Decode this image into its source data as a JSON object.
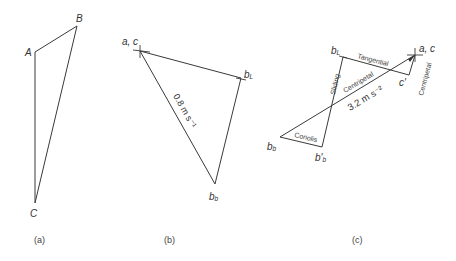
{
  "figure": {
    "panels": [
      {
        "id": "a",
        "caption": "(a)",
        "points": {
          "A": {
            "label": "A",
            "x": 35,
            "y": 52
          },
          "B": {
            "label": "B",
            "x": 77,
            "y": 26
          },
          "C": {
            "label": "C",
            "x": 35,
            "y": 203
          }
        },
        "edges": [
          [
            "A",
            "B"
          ],
          [
            "B",
            "C"
          ],
          [
            "A",
            "C"
          ]
        ]
      },
      {
        "id": "b",
        "caption": "(b)",
        "points": {
          "ac": {
            "label": "a, c",
            "x": 140,
            "y": 51
          },
          "bL": {
            "label": "b",
            "sub": "L",
            "x": 241,
            "y": 78
          },
          "bb": {
            "label": "b",
            "sub": "b",
            "x": 215,
            "y": 184
          }
        },
        "edges": [
          [
            "ac",
            "bL"
          ],
          [
            "bL",
            "bb"
          ],
          [
            "ac",
            "bb"
          ]
        ],
        "annotation": "0.8 m s⁻¹"
      },
      {
        "id": "c",
        "caption": "(c)",
        "points": {
          "ac": {
            "label": "a, c",
            "x": 415,
            "y": 55
          },
          "bL": {
            "label": "b",
            "sub": "L",
            "x": 343,
            "y": 57
          },
          "cp": {
            "label": "c'",
            "x": 409,
            "y": 75
          },
          "bb": {
            "label": "b",
            "sub": "b",
            "x": 280,
            "y": 137
          },
          "bbp": {
            "label": "b'",
            "sub": "b",
            "x": 322,
            "y": 147
          }
        },
        "edges": [
          [
            "bL",
            "cp"
          ],
          [
            "cp",
            "ac"
          ],
          [
            "bb",
            "ac"
          ],
          [
            "bb",
            "bbp"
          ],
          [
            "bbp",
            "bL"
          ]
        ],
        "edge_labels": {
          "tangential": "Tangential",
          "centripetal_short": "Centripetal",
          "centripetal_long": "Centripetal",
          "sliding": "Sliding",
          "coriolis": "Coriolis",
          "magnitude": "3.2 m s⁻²"
        }
      }
    ]
  }
}
